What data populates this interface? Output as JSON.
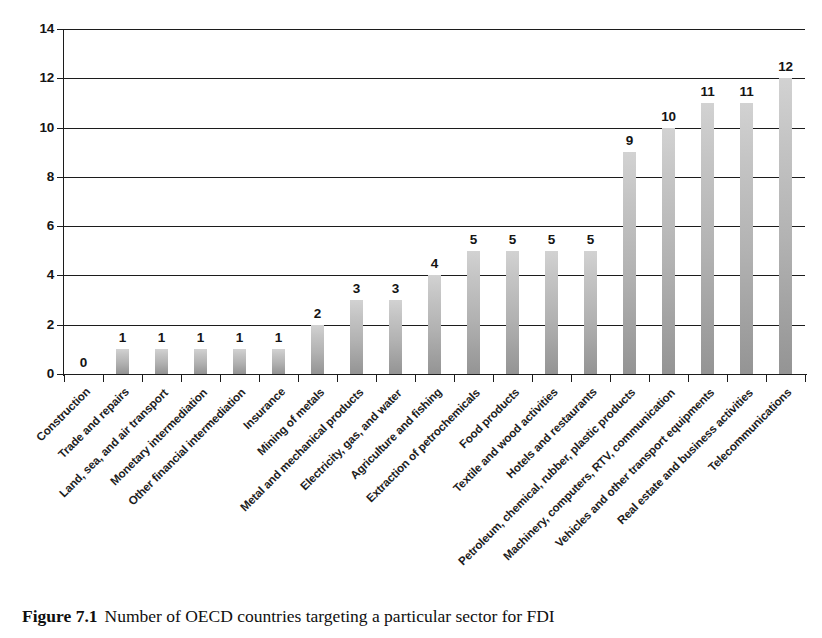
{
  "caption": {
    "number": "Figure 7.1",
    "text": "Number of OECD countries targeting a particular sector for FDI"
  },
  "chart_data": {
    "type": "bar",
    "title": "Number of OECD countries targeting a particular sector for FDI",
    "xlabel": "",
    "ylabel": "",
    "ylim": [
      0,
      14
    ],
    "ytick_step": 2,
    "yticks": [
      0,
      2,
      4,
      6,
      8,
      10,
      12,
      14
    ],
    "grid": "horizontal",
    "legend": "none",
    "show_value_labels": true,
    "bar_color_top": "#d2d2d2",
    "bar_color_bottom": "#949494",
    "axis_color": "#1c1c1c",
    "background": "#ffffff",
    "categories": [
      "Construction",
      "Trade and repairs",
      "Land, sea, and air transport",
      "Monetary intermediation",
      "Other financial intermediation",
      "Insurance",
      "Mining of metals",
      "Metal and mechanical products",
      "Electricity, gas, and water",
      "Agriculture and fishing",
      "Extraction of petrochemicals",
      "Food products",
      "Textile and wood activities",
      "Hotels and restaurants",
      "Petroleum, chemical, rubber, plastic products",
      "Machinery, computers, RTV, communication",
      "Vehicles and other transport equipments",
      "Real estate and business activities",
      "Telecommunications"
    ],
    "values": [
      0,
      1,
      1,
      1,
      1,
      1,
      2,
      3,
      3,
      4,
      5,
      5,
      5,
      5,
      9,
      10,
      11,
      11,
      12
    ]
  }
}
